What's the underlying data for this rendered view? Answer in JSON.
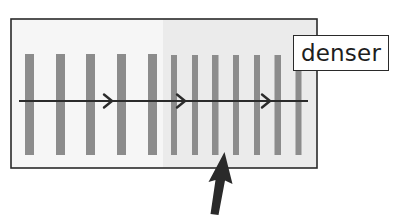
{
  "diagram": {
    "label": "denser",
    "colors": {
      "frame_border": "#2a2a2a",
      "background_sparse": "#f6f6f6",
      "background_dense": "#ebebeb",
      "bar": "#8c8c8c",
      "line": "#2b2b2b",
      "pointer_arrow": "#2a2a2a"
    },
    "sparse_region": {
      "bar_count": 5,
      "bar_width": 9,
      "spacing": 31
    },
    "dense_region": {
      "bar_count": 7,
      "bar_width": 6,
      "spacing": 20.8
    },
    "flow_direction": "left-to-right",
    "chevron_count": 3
  }
}
